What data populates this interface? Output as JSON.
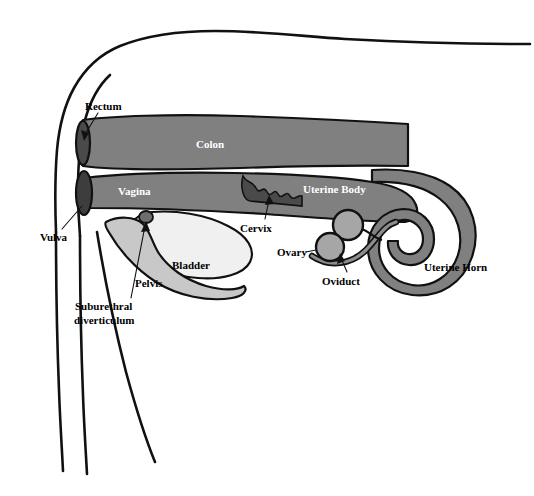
{
  "figure": {
    "background_color": "#ffffff",
    "line_color": "#111111"
  },
  "palette": {
    "colon_fill": "#808080",
    "vagina_fill": "#808080",
    "uterus_fill": "#808080",
    "uterine_horn_fill": "#808080",
    "ovary_fill": "#a6a6a6",
    "oviduct_fill": "#8c8c8c",
    "bladder_fill": "#f0f0f0",
    "pelvis_fill": "#c8c8c8",
    "vaginal_opening_fill": "#3d3d3d",
    "rectum_opening_fill": "#4a4a4a",
    "cervix_lumen_fill": "#4a4a4a",
    "label_dark": "#000000",
    "label_light": "#ffffff"
  },
  "labels": {
    "rectum": "Rectum",
    "colon": "Colon",
    "vagina": "Vagina",
    "vulva": "Vulva",
    "cervix": "Cervix",
    "uterine_body": "Uterine Body",
    "uterine_horn": "Uterine Horn",
    "ovary": "Ovary",
    "oviduct": "Oviduct",
    "bladder": "Bladder",
    "pelvis": "Pelvis",
    "suburethral_diverticulum_line1": "Suburethral",
    "suburethral_diverticulum_line2": "diverticulum"
  }
}
